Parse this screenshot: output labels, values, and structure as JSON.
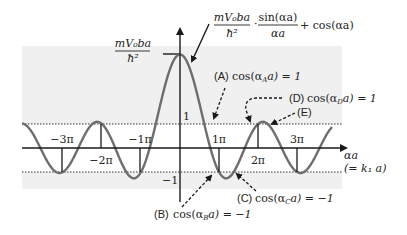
{
  "diagram": {
    "title_formula": {
      "fraction1_num": "mV₀ba",
      "fraction1_den": "ħ²",
      "dot": "·",
      "fraction2_num": "sin(αa)",
      "fraction2_den": "αa",
      "tail": "+ cos(αa)"
    },
    "y_axis": {
      "peak_label_num": "mV₀ba",
      "peak_label_den": "ħ²",
      "tick_plus1": "1",
      "tick_minus1": "−1"
    },
    "x_axis": {
      "label_line1": "αa",
      "label_line2": "(= k₁ a)",
      "ticks": [
        "−3π",
        "−2π",
        "−1π",
        "1π",
        "2π",
        "3π"
      ]
    },
    "annotations": {
      "A": "(A) cos(αₐa) = 1",
      "A_label": "(A)",
      "A_expr": "cos(α",
      "A_sub": "A",
      "A_rest": "a) = 1",
      "B_label": "(B)",
      "B_expr": "cos(α",
      "B_sub": "B",
      "B_rest": "a) = −1",
      "C_label": "(C)",
      "C_expr": "cos(α",
      "C_sub": "C",
      "C_rest": "a) = −1",
      "D_label": "(D)",
      "D_expr": "cos(α",
      "D_sub": "D",
      "D_rest": "a) = 1",
      "E_label": "(E)"
    },
    "colors": {
      "curve": "#6e6e6e",
      "shade": "#f0f0f0",
      "axis": "#1a1a1a",
      "text": "#222222"
    },
    "parameters": {
      "P": 2.9,
      "band_upper": 1,
      "band_lower": -1
    }
  }
}
